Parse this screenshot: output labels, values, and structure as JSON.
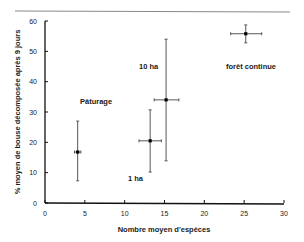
{
  "chart_data": {
    "type": "scatter",
    "title": "",
    "xlabel": "Nombre moyen d'espèces",
    "ylabel": "% moyen de bouse décomposée après 9 jours",
    "xlim": [
      0,
      30
    ],
    "ylim": [
      0,
      60
    ],
    "x_ticks": [
      "0",
      "5",
      "10",
      "15",
      "20",
      "25",
      "30"
    ],
    "y_ticks": [
      "0",
      "10",
      "20",
      "30",
      "40",
      "50",
      "60"
    ],
    "grid": false,
    "legend": "none",
    "points": [
      {
        "label": "Pâturage",
        "x": 4.1,
        "y": 16.8,
        "x_err": [
          3.7,
          4.5
        ],
        "y_err": [
          7.3,
          27.0
        ]
      },
      {
        "label": "1 ha",
        "x": 13.2,
        "y": 20.5,
        "x_err": [
          11.8,
          14.6
        ],
        "y_err": [
          10.2,
          30.7
        ]
      },
      {
        "label": "10 ha",
        "x": 15.2,
        "y": 34.0,
        "x_err": [
          13.7,
          16.8
        ],
        "y_err": [
          13.9,
          54.0
        ]
      },
      {
        "label": "forêt continue",
        "x": 25.2,
        "y": 55.8,
        "x_err": [
          23.3,
          27.2
        ],
        "y_err": [
          52.8,
          58.7
        ]
      }
    ]
  },
  "labels": {
    "xlabel": "Nombre moyen d'espèces",
    "ylabel": "% moyen de bouse décomposée après 9 jours",
    "paturage": "Pâturage",
    "one_ha": "1 ha",
    "ten_ha": "10 ha",
    "foret": "forêt continue"
  }
}
